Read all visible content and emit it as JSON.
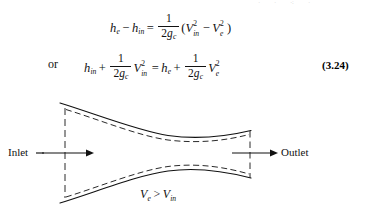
{
  "page": {
    "background_color": "#ffffff",
    "ink_color": "#111111",
    "top_cropped_sliver": "· ·  ⁖  ·"
  },
  "equations": [
    {
      "id": "eq-continuity-energy",
      "number": "",
      "lhs": {
        "terms": [
          {
            "sym": "h",
            "sub": "e"
          },
          {
            "op": "−"
          },
          {
            "sym": "h",
            "sub": "in"
          }
        ]
      },
      "relation": "=",
      "rhs": {
        "fraction": {
          "numerator": "1",
          "denominator_coeff": "2",
          "denominator_sym": "g",
          "denominator_sub": "c"
        },
        "group": [
          {
            "sym": "V",
            "sub": "in",
            "sup": "2"
          },
          {
            "op": "−"
          },
          {
            "sym": "V",
            "sub": "e",
            "sup": "2"
          }
        ]
      },
      "plain": "h_e - h_in = 1/(2g_c) (V_in^2 - V_e^2)"
    },
    {
      "id": "eq-3-24",
      "number": "(3.24)",
      "connector": "or",
      "lhs": {
        "terms": [
          {
            "sym": "h",
            "sub": "in"
          },
          {
            "op": "+"
          },
          {
            "fraction": {
              "numerator": "1",
              "denominator_coeff": "2",
              "denominator_sym": "g",
              "denominator_sub": "c"
            }
          },
          {
            "sym": "V",
            "sub": "in",
            "sup": "2"
          }
        ]
      },
      "relation": "=",
      "rhs": {
        "terms": [
          {
            "sym": "h",
            "sub": "e"
          },
          {
            "op": "+"
          },
          {
            "fraction": {
              "numerator": "1",
              "denominator_coeff": "2",
              "denominator_sym": "g",
              "denominator_sub": "c"
            }
          },
          {
            "sym": "V",
            "sub": "e",
            "sup": "2"
          }
        ]
      },
      "plain": "h_in + 1/(2g_c) V_in^2 = h_e + 1/(2g_c) V_e^2"
    }
  ],
  "symbols": {
    "one": "1",
    "two": "2",
    "g": "g",
    "c": "c",
    "h": "h",
    "V": "V",
    "e": "e",
    "in": "in",
    "two_sup": "2",
    "minus": "−",
    "plus": "+",
    "equals": "=",
    "lparen": "(",
    "rparen": ")",
    "or": "or"
  },
  "figure": {
    "name": "converging-diverging-nozzle-diagram",
    "inlet_label": "Inlet",
    "outlet_label": "Outlet",
    "velocity_relation": {
      "left_sym": "V",
      "left_sub": "e",
      "operator": ">",
      "right_sym": "V",
      "right_sub": "in",
      "plain": "V_e > V_in"
    },
    "line_color": "#111111",
    "dash_color": "#2a2a2a",
    "solid_wall_width": 1.1,
    "dashed_streamline_width": 1.0,
    "geometry": {
      "inlet_plane_x": 65,
      "outlet_plane_x": 250,
      "throat_x": 168,
      "axis_y": 69,
      "inlet_upper_y": 19,
      "inlet_lower_y": 119,
      "throat_upper_y": 52,
      "throat_lower_y": 87,
      "outlet_upper_y": 47,
      "outlet_lower_y": 94
    }
  }
}
